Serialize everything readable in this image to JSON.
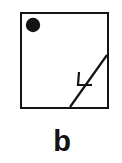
{
  "figure": {
    "caption": "b",
    "canvas": {
      "width": 122,
      "height": 163,
      "background_color": "#ffffff"
    },
    "stroke_color": "#141414",
    "fill_color": "#141414",
    "elements": {
      "square": {
        "name": "boundary square",
        "x": 21,
        "y": 13,
        "width": 87,
        "height": 95,
        "stroke_width": 2.4
      },
      "dot": {
        "name": "filled circle marker",
        "cx": 33,
        "cy": 25,
        "r": 7.2
      },
      "diagonal": {
        "name": "diagonal line",
        "x1": 70,
        "y1": 107,
        "x2": 107,
        "y2": 55,
        "stroke_width": 2.2
      },
      "arrowhead": {
        "name": "open v arrowhead",
        "apex_x": 78,
        "apex_y": 85,
        "barb_up_x": 79,
        "barb_up_y": 72,
        "barb_side_x": 92,
        "barb_side_y": 85,
        "stroke_width": 2.2,
        "direction": "down-left"
      }
    }
  }
}
